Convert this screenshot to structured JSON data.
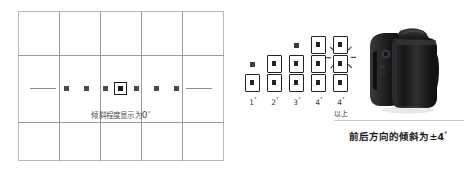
{
  "viewfinder": {
    "name": "camera-viewfinder-grid",
    "grid": {
      "columns": 5,
      "rows": 3
    },
    "scale": {
      "tick_count": 7,
      "center_index": 3,
      "center_highlighted": true
    },
    "caption_prefix": "倾斜程度显示为",
    "caption_value": "0",
    "caption_degree": "°"
  },
  "steps": {
    "name": "tilt-step-indicator",
    "columns": [
      {
        "label": "1",
        "degree": "°",
        "sublabel": "",
        "filled_boxes": 1,
        "top_dot": true
      },
      {
        "label": "2",
        "degree": "°",
        "sublabel": "",
        "filled_boxes": 2,
        "top_dot": false
      },
      {
        "label": "3",
        "degree": "°",
        "sublabel": "",
        "filled_boxes": 2,
        "top_dot": true
      },
      {
        "label": "4",
        "degree": "°",
        "sublabel": "",
        "filled_boxes": 3,
        "top_dot": false
      },
      {
        "label": "4",
        "degree": "°",
        "sublabel": "以上",
        "filled_boxes": 4,
        "top_dot": false,
        "blinking": true
      }
    ]
  },
  "camera": {
    "name": "dslr-camera-side-view",
    "caption": "前后方向的倾斜为±4",
    "caption_degree": "°"
  },
  "colors": {
    "grid_line": "#9a9a9a",
    "frame_border": "#b9b9b9",
    "marker": "#222222",
    "caption_text": "#1a1a1a",
    "muted_text": "#4f4f4f"
  }
}
